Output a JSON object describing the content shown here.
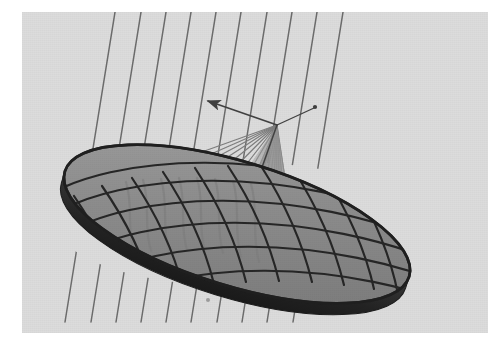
{
  "figure": {
    "title": "Parabolic reflector antenna with incoming parallel rays converging at the focal point",
    "kind": "3d-line-diagram"
  },
  "canvas": {
    "width": 488,
    "height": 345,
    "border_color": "#ffffff",
    "border_left": 22,
    "border_top": 12,
    "border_bottom": 12,
    "border_right": 0
  },
  "colors": {
    "page_background": "#ffffff",
    "scene_background": "#dcdcdc",
    "dish_surface_light": "#9a9a9a",
    "dish_surface_mid": "#8a8a8a",
    "dish_surface_dark": "#6f6f6f",
    "dish_rim_edge": "#2b2b2b",
    "grid_line": "#2e2e2e",
    "incoming_ray": "#6a6a6a",
    "reflected_ray": "#7a7a7a",
    "focal_cone": "#9d9d9d",
    "axis_arrow": "#4a4a4a",
    "shadow_streak": "#8f8f8f"
  },
  "scene": {
    "focal_point": {
      "label": "focal-point",
      "x": 277,
      "y": 125
    },
    "dish": {
      "label": "parabolic-dish-reflector",
      "center_x": 237,
      "center_y": 224,
      "radius_x": 180,
      "radius_y": 62,
      "rotation_deg": 17,
      "thickness": 14,
      "radial_line_count": 14,
      "concentric_ring_count": 5
    },
    "incoming_rays": {
      "label": "incoming-parallel-rays",
      "count": 10,
      "angle_deg": 9.5,
      "top_x_positions": [
        116,
        142,
        167,
        192,
        217,
        242,
        268,
        293,
        318,
        344
      ],
      "description": "Parallel plane-wave rays arriving from the source direction"
    },
    "reflected_rays": {
      "label": "reflected-converging-rays",
      "count": 17,
      "description": "Rays reflected off the paraboloid surface converging to the focal point"
    },
    "axis_indicators": [
      {
        "label": "feed-axis-arrow",
        "from_x": 277,
        "from_y": 125,
        "to_x": 206,
        "to_y": 101,
        "has_arrowhead": true
      },
      {
        "label": "secondary-axis-tick",
        "from_x": 277,
        "from_y": 125,
        "to_x": 314,
        "to_y": 108,
        "has_arrowhead": false
      },
      {
        "label": "boresight-arrow",
        "from_x": 277,
        "from_y": 125,
        "to_x": 252,
        "to_y": 187,
        "has_arrowhead": true
      }
    ],
    "artifacts": [
      {
        "label": "scan-speck",
        "x": 208,
        "y": 300,
        "r": 2
      }
    ]
  }
}
